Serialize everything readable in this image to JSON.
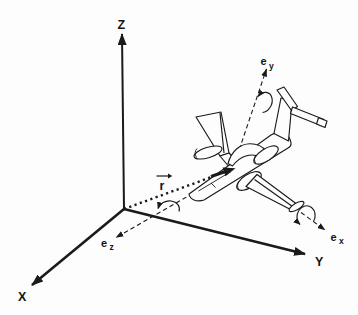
{
  "figure": {
    "background_color": "#fdfdfd",
    "ink_color": "#1a1a1a",
    "inertial_frame": {
      "x_label": "X",
      "y_label": "Y",
      "z_label": "Z"
    },
    "body_frame": {
      "base_symbol": "e",
      "x_subscript": "x",
      "y_subscript": "y",
      "z_subscript": "z"
    },
    "position_vector_label": "r"
  }
}
